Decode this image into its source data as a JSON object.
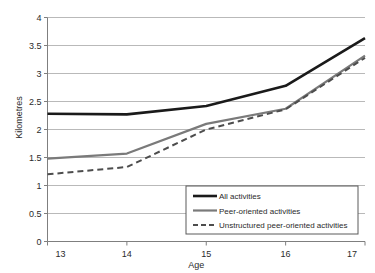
{
  "chart_data": {
    "type": "line",
    "title": "",
    "xlabel": "Age",
    "ylabel": "Kilometres",
    "categories": [
      "13",
      "14",
      "15",
      "16",
      "17"
    ],
    "x": [
      13,
      14,
      15,
      16,
      17
    ],
    "xlim": [
      13,
      17
    ],
    "ylim": [
      0,
      4
    ],
    "yticks": [
      "0",
      "0.5",
      "1",
      "1.5",
      "2",
      "2.5",
      "3",
      "3.5",
      "4"
    ],
    "ytick_values": [
      0,
      0.5,
      1,
      1.5,
      2,
      2.5,
      3,
      3.5,
      4
    ],
    "grid": true,
    "legend_position": "bottom-right",
    "series": [
      {
        "name": "All activities",
        "values": [
          2.28,
          2.27,
          2.42,
          2.78,
          3.63
        ],
        "color": "#1a1a1a",
        "style": "solid",
        "width": 2.6
      },
      {
        "name": "Peer-oriented activities",
        "values": [
          1.48,
          1.57,
          2.1,
          2.37,
          3.32
        ],
        "color": "#7a7a7a",
        "style": "solid",
        "width": 2.2
      },
      {
        "name": "Unstructured peer-oriented activities",
        "values": [
          1.2,
          1.33,
          2.0,
          2.36,
          3.28
        ],
        "color": "#4d4d4d",
        "style": "dashed",
        "width": 2.0
      }
    ]
  },
  "colors": {
    "grid": "#b9b9b9",
    "axis": "#7f7f7f",
    "legend_border": "#5a5a5a",
    "background": "#ffffff"
  }
}
